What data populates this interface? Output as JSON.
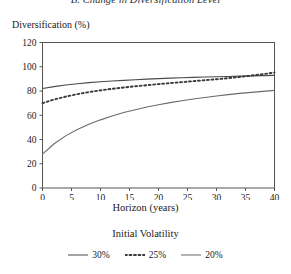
{
  "panel_title": "B. Change in Diversification Level",
  "chart_data": {
    "type": "line",
    "title": "B. Change in Diversification Level",
    "xlabel": "Horizon (years)",
    "ylabel": "Diversification (%)",
    "xlim": [
      0,
      40
    ],
    "ylim": [
      0,
      120
    ],
    "xticks": [
      "0",
      "5",
      "10",
      "15",
      "20",
      "25",
      "30",
      "35",
      "40"
    ],
    "yticks": [
      "0",
      "20",
      "40",
      "60",
      "80",
      "100",
      "120"
    ],
    "grid": false,
    "legend_title": "Initial Volatility",
    "legend_position": "bottom",
    "x": [
      0,
      2,
      4,
      6,
      8,
      10,
      12,
      14,
      16,
      18,
      20,
      22,
      24,
      26,
      28,
      30,
      32,
      34,
      36,
      38,
      40
    ],
    "series": [
      {
        "name": "30%",
        "style": "solid",
        "color": "#4a4a4a",
        "values": [
          82.0,
          83.6,
          84.9,
          86.0,
          86.9,
          87.6,
          88.3,
          88.8,
          89.3,
          89.8,
          90.2,
          90.6,
          90.9,
          91.2,
          91.5,
          91.8,
          92.0,
          92.3,
          92.5,
          92.7,
          92.9
        ]
      },
      {
        "name": "25%",
        "style": "dotted",
        "color": "#3a3a3a",
        "values": [
          70.0,
          73.0,
          75.4,
          77.4,
          79.1,
          80.5,
          81.8,
          82.9,
          83.9,
          84.8,
          85.7,
          86.5,
          87.3,
          88.1,
          88.9,
          89.7,
          90.6,
          91.6,
          92.7,
          93.9,
          95.2
        ]
      },
      {
        "name": "20%",
        "style": "solid",
        "color": "#6a6a6a",
        "values": [
          28.0,
          36.5,
          43.0,
          48.2,
          52.5,
          56.2,
          59.4,
          62.2,
          64.6,
          66.8,
          68.7,
          70.4,
          72.0,
          73.4,
          74.7,
          75.9,
          77.0,
          78.0,
          78.9,
          79.7,
          80.5
        ]
      }
    ]
  },
  "legend": {
    "title": "Initial Volatility",
    "entries": [
      {
        "label": "30%"
      },
      {
        "label": "25%"
      },
      {
        "label": "20%"
      }
    ]
  }
}
